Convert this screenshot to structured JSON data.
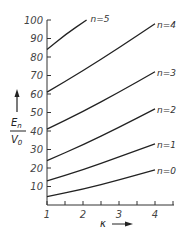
{
  "chart_data": {
    "type": "line",
    "title": "",
    "xlabel": "κ",
    "ylabel": "E_n / V_0",
    "xlim": [
      1,
      4.5
    ],
    "ylim": [
      0,
      100
    ],
    "x_ticks": [
      "1",
      "2",
      "3",
      "4"
    ],
    "y_ticks": [
      "10",
      "20",
      "30",
      "40",
      "50",
      "60",
      "70",
      "80",
      "90",
      "100"
    ],
    "grid": false,
    "legend": "inline labels at curve ends",
    "series": [
      {
        "name": "n=0",
        "x": [
          1,
          2,
          3,
          4
        ],
        "values": [
          4.5,
          8.5,
          13.5,
          19
        ]
      },
      {
        "name": "n=1",
        "x": [
          1,
          2,
          3,
          4
        ],
        "values": [
          13,
          19,
          26,
          33
        ]
      },
      {
        "name": "n=2",
        "x": [
          1,
          2,
          3,
          4
        ],
        "values": [
          24,
          32.5,
          42,
          52
        ]
      },
      {
        "name": "n=3",
        "x": [
          1,
          2,
          3,
          4
        ],
        "values": [
          41,
          50.5,
          61,
          72
        ]
      },
      {
        "name": "n=4",
        "x": [
          1,
          2,
          3,
          4
        ],
        "values": [
          61,
          72.5,
          85,
          98
        ]
      },
      {
        "name": "n=5",
        "x": [
          1,
          1.5,
          2.1
        ],
        "values": [
          84,
          92,
          100
        ]
      }
    ]
  },
  "labels": {
    "y_axis_top": "E",
    "y_axis_top_sub": "n",
    "y_axis_bottom": "V",
    "y_axis_bottom_sub": "0",
    "x_axis": "κ"
  }
}
